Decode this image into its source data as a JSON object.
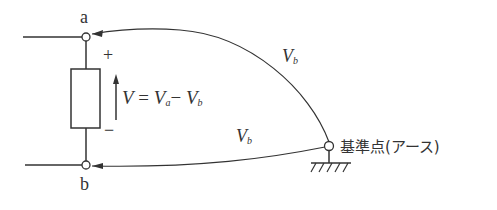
{
  "diagram": {
    "type": "circuit",
    "nodes": {
      "a": {
        "label": "a"
      },
      "b": {
        "label": "b"
      },
      "ground": {
        "label": "基準点(アース)"
      }
    },
    "polarity": {
      "plus": "+",
      "minus": "−"
    },
    "equation": {
      "v": "V",
      "eq": " = ",
      "va": "V",
      "va_sub": "a",
      "minus": "− ",
      "vb": "V",
      "vb_sub": "b"
    },
    "upper_curve_label": {
      "v": "V",
      "sub": "b"
    },
    "lower_curve_label": {
      "v": "V",
      "sub": "b"
    }
  }
}
